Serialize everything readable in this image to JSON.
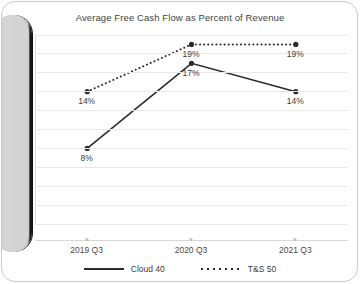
{
  "chart_data": {
    "type": "line",
    "title": "Average Free Cash Flow as Percent of Revenue",
    "xlabel": "",
    "ylabel": "",
    "categories": [
      "2019 Q3",
      "2020 Q3",
      "2021 Q3"
    ],
    "ylim": [
      0,
      20
    ],
    "ytick_labels": [
      "20%",
      "18%",
      "16%",
      "14%",
      "12%",
      "10%",
      "8%",
      "6%",
      "4%",
      "2%",
      "0%"
    ],
    "ytick_values": [
      20,
      18,
      16,
      14,
      12,
      10,
      8,
      6,
      4,
      2,
      0
    ],
    "grid": true,
    "legend_position": "bottom",
    "series": [
      {
        "name": "Cloud 40",
        "style": "solid",
        "color": "#2b2b2b",
        "values": [
          8,
          17,
          14
        ],
        "data_labels": [
          "8%",
          "17%",
          "14%"
        ]
      },
      {
        "name": "T&S 50",
        "style": "dotted",
        "color": "#2b2b2b",
        "values": [
          14,
          19,
          19
        ],
        "data_labels": [
          "14%",
          "19%",
          "19%"
        ]
      }
    ]
  },
  "legend": {
    "items": [
      {
        "label": "Cloud 40"
      },
      {
        "label": "T&S 50"
      }
    ]
  },
  "scrollbar": {
    "name": "vertical-scrollbar"
  }
}
